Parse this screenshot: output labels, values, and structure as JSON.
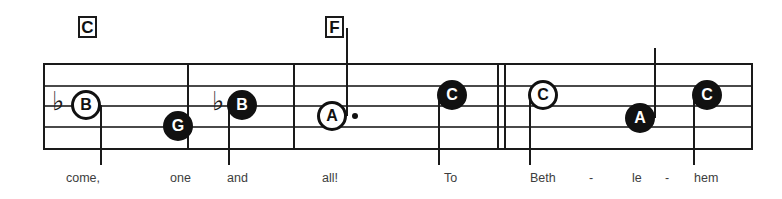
{
  "sheet": {
    "title": "Music notation staff excerpt",
    "staff": {
      "left": 43,
      "right": 751,
      "top": 63,
      "bottom": 148,
      "line_count": 5,
      "line_ys": [
        63,
        85,
        105,
        126,
        148
      ],
      "line_color": "#4a4a4a",
      "outer_line_color": "#1a1a1a"
    },
    "chords": [
      {
        "label": "C",
        "x": 78,
        "y": 16,
        "w": 19,
        "h": 22
      },
      {
        "label": "F",
        "x": 325,
        "y": 16,
        "w": 19,
        "h": 22
      }
    ],
    "barlines": [
      {
        "x": 43,
        "top": 63,
        "bottom": 148,
        "kind": "single"
      },
      {
        "x": 187,
        "top": 63,
        "bottom": 148,
        "kind": "single"
      },
      {
        "x": 293,
        "top": 63,
        "bottom": 148,
        "kind": "single"
      },
      {
        "x": 497,
        "top": 63,
        "bottom": 148,
        "kind": "single"
      },
      {
        "x": 504,
        "top": 63,
        "bottom": 148,
        "kind": "single"
      },
      {
        "x": 751,
        "top": 63,
        "bottom": 148,
        "kind": "single"
      }
    ],
    "accidentals": [
      {
        "symbol": "♭",
        "name": "flat",
        "x": 52,
        "y": 88
      },
      {
        "symbol": "♭",
        "name": "flat",
        "x": 212,
        "y": 88
      }
    ],
    "notes": [
      {
        "letter": "B",
        "style": "hollow",
        "cx": 86,
        "cy": 105,
        "stem": {
          "x": 100,
          "y_top": 105,
          "y_bottom": 165
        },
        "dotted": false
      },
      {
        "letter": "G",
        "style": "filled",
        "cx": 178,
        "cy": 126,
        "stem": null,
        "dotted": false
      },
      {
        "letter": "B",
        "style": "filled",
        "cx": 242,
        "cy": 105,
        "stem": {
          "x": 228,
          "y_top": 105,
          "y_bottom": 165
        },
        "dotted": false
      },
      {
        "letter": "A",
        "style": "hollow",
        "cx": 332,
        "cy": 116,
        "stem": {
          "x": 346,
          "y_top": 28,
          "y_bottom": 116
        },
        "dotted": true,
        "dot_x": 352,
        "dot_y": 113
      },
      {
        "letter": "C",
        "style": "filled",
        "cx": 452,
        "cy": 95,
        "stem": {
          "x": 438,
          "y_top": 95,
          "y_bottom": 165
        },
        "dotted": false
      },
      {
        "letter": "C",
        "style": "hollow",
        "cx": 543,
        "cy": 95,
        "stem": {
          "x": 529,
          "y_top": 95,
          "y_bottom": 165
        },
        "dotted": false
      },
      {
        "letter": "A",
        "style": "filled",
        "cx": 640,
        "cy": 118,
        "stem": {
          "x": 654,
          "y_top": 48,
          "y_bottom": 118
        },
        "dotted": false
      },
      {
        "letter": "C",
        "style": "filled",
        "cx": 707,
        "cy": 95,
        "stem": {
          "x": 693,
          "y_top": 95,
          "y_bottom": 165
        },
        "dotted": false
      }
    ],
    "lyrics": [
      {
        "text": "come,",
        "x": 66,
        "y": 172
      },
      {
        "text": "one",
        "x": 170,
        "y": 172
      },
      {
        "text": "and",
        "x": 227,
        "y": 172
      },
      {
        "text": "all!",
        "x": 322,
        "y": 172
      },
      {
        "text": "To",
        "x": 444,
        "y": 172
      },
      {
        "text": "Beth",
        "x": 530,
        "y": 172
      },
      {
        "text": "-",
        "x": 589,
        "y": 172
      },
      {
        "text": "le",
        "x": 632,
        "y": 172
      },
      {
        "text": "-",
        "x": 665,
        "y": 172
      },
      {
        "text": "hem",
        "x": 694,
        "y": 172
      }
    ]
  }
}
